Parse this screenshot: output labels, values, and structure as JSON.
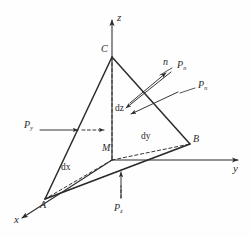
{
  "figure": {
    "background_color": "#fefefe",
    "line_color": "#2b2b2b",
    "width": 251,
    "height": 237
  },
  "axes": [
    {
      "name": "z-axis",
      "label": "z",
      "direction": "up"
    },
    {
      "name": "y-axis",
      "label": "y",
      "direction": "right"
    },
    {
      "name": "x-axis",
      "label": "x",
      "direction": "down-left"
    }
  ],
  "vertices": [
    {
      "name": "vertex-c",
      "label": "C",
      "on_axis": "z"
    },
    {
      "name": "vertex-b",
      "label": "B",
      "on_axis": "y"
    },
    {
      "name": "vertex-a",
      "label": "A",
      "on_axis": "x"
    },
    {
      "name": "vertex-m",
      "label": "M",
      "on_axis": "origin"
    }
  ],
  "dimensions": [
    {
      "name": "dimension-dz",
      "label": "dz",
      "along": "z"
    },
    {
      "name": "dimension-dy",
      "label": "dy",
      "along": "y"
    },
    {
      "name": "dimension-dx",
      "label": "dx",
      "along": "x"
    }
  ],
  "normal": {
    "label": "n",
    "description": "outward unit normal of inclined face ABC"
  },
  "pressures": [
    {
      "name": "pressure-py",
      "label": "P",
      "subscript": "y",
      "position": "left",
      "arrow": "points-right"
    },
    {
      "name": "pressure-pn-upper",
      "label": "P",
      "subscript": "n",
      "position": "upper-right",
      "arrow": "leader-to-normal"
    },
    {
      "name": "pressure-pn-lower",
      "label": "P",
      "subscript": "n",
      "position": "right",
      "arrow": "points-down-left"
    },
    {
      "name": "pressure-pz",
      "label": "P",
      "subscript": "z",
      "position": "bottom",
      "arrow": "points-up"
    }
  ]
}
